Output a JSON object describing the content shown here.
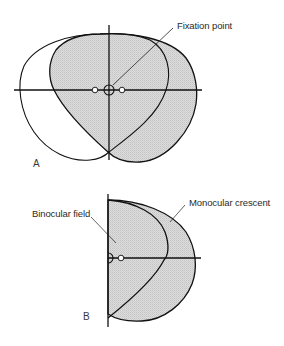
{
  "figure": {
    "panel_a": {
      "letter": "A",
      "labels": {
        "fixation_point": "Fixation point"
      }
    },
    "panel_b": {
      "letter": "B",
      "labels": {
        "binocular_field": "Binocular field",
        "monocular_crescent": "Monocular crescent"
      }
    },
    "colors": {
      "stroke": "#111111",
      "shade": "#d4d4d4",
      "background": "#ffffff"
    }
  }
}
